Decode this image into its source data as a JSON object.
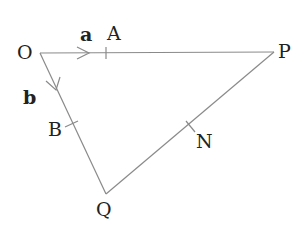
{
  "diagram": {
    "type": "vector-triangle",
    "points": {
      "O": {
        "label": "O",
        "x": 40,
        "y": 53
      },
      "P": {
        "label": "P",
        "x": 274,
        "y": 52
      },
      "Q": {
        "label": "Q",
        "x": 106,
        "y": 194
      },
      "A": {
        "label": "A",
        "x": 106,
        "y": 53
      },
      "B": {
        "label": "B",
        "x": 71,
        "y": 124
      },
      "N": {
        "label": "N",
        "x": 190,
        "y": 127
      }
    },
    "vectors": {
      "a": {
        "label": "a",
        "from": "O",
        "to": "A"
      },
      "b": {
        "label": "b",
        "from": "O",
        "to": "B"
      }
    },
    "line_color": "#8a8a8a",
    "text_color": "#222222"
  }
}
